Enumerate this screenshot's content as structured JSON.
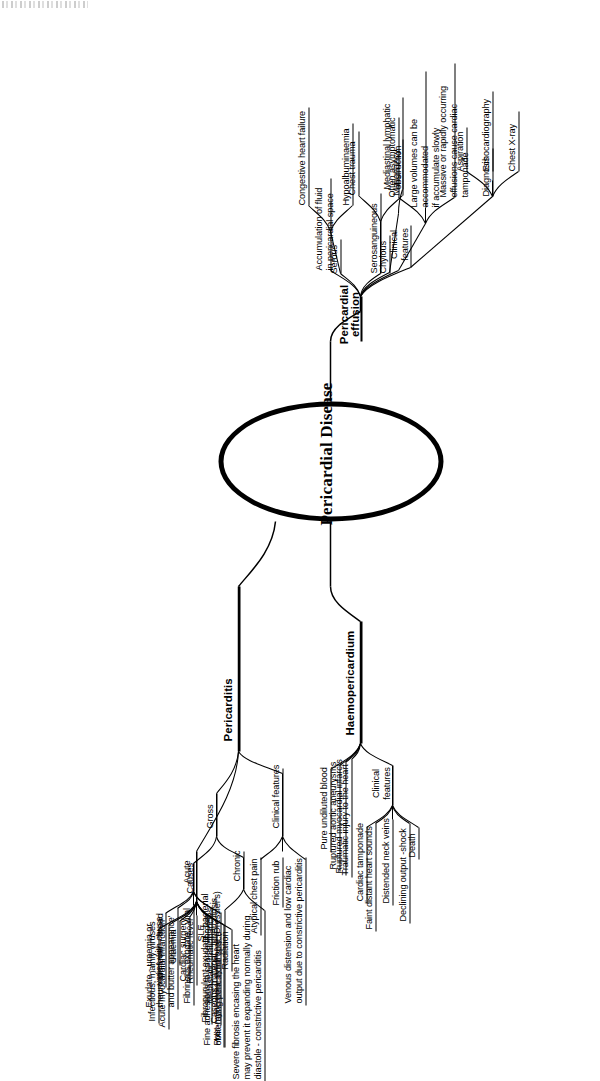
{
  "page": {
    "watermark": "",
    "width": 600,
    "height": 1041,
    "orientation": "rotated-90-ccw"
  },
  "diagram": {
    "type": "mind-map",
    "centre": "Pericardial Disease",
    "branches": [
      {
        "id": "pericarditis",
        "label": "Pericarditis",
        "children": [
          {
            "id": "causes",
            "label": "Causes",
            "children": [
              {
                "label": "Infectious, mainly viruses"
              },
              {
                "label": "Acute myocardial infarction"
              },
              {
                "label": "Uraemia"
              },
              {
                "label": "Cardiac surgery"
              },
              {
                "label": "Rheumatic fever"
              },
              {
                "label": "SLE"
              },
              {
                "label": "Metastatic malignancies"
              },
              {
                "label": "Post-myocardial syndrome (Dressler's)"
              },
              {
                "label": "Radiation"
              }
            ]
          },
          {
            "id": "gross",
            "label": "Gross",
            "children": [
              {
                "id": "acute",
                "label": "Acute",
                "children": [
                  {
                    "label": "varies with cause"
                  },
                  {
                    "label": "Exudate - uraemia or rheumatic fever - 'bread and butter appearance'"
                  },
                  {
                    "label": "Fibrinous exudate - viral"
                  },
                  {
                    "label": "Fibropurulent exudate - bacterial"
                  },
                  {
                    "label": "Caseous material - tuberculosis"
                  }
                ]
              },
              {
                "id": "chronic",
                "label": "Chronic",
                "children": [
                  {
                    "label": "Fine adhesions to coarse fibrosis obliterating pericardial space"
                  },
                  {
                    "label": "Severe fibrosis encasing the heart may prevent it expanding normally during diastole - constrictive pericarditis"
                  }
                ]
              }
            ]
          },
          {
            "id": "pericarditis-clinical",
            "label": "Clinical features",
            "children": [
              {
                "label": "Atypical chest pain"
              },
              {
                "label": "Friction rub"
              },
              {
                "label": "Venous distension and low cardiac output due to constrictive pericarditis"
              }
            ]
          }
        ]
      },
      {
        "id": "haemopericardium",
        "label": "Haemopericardium",
        "children": [
          {
            "label": "Pure undiluted blood"
          },
          {
            "label": "Ruptured aortic aneurysms"
          },
          {
            "label": "Ruptured myocardial infarcts"
          },
          {
            "label": "Traumatic injury to the heart"
          },
          {
            "id": "haemo-clinical",
            "label": "Clinical features",
            "children": [
              {
                "label": "Cardiac tamponade"
              },
              {
                "label": "Faint distant heart sounds"
              },
              {
                "label": "Distended neck veins"
              },
              {
                "label": "Declining output -shock"
              },
              {
                "label": "Death"
              }
            ]
          }
        ]
      },
      {
        "id": "pericardial-effusion",
        "label": "Pericardial effusion",
        "children": [
          {
            "label": "Accumulation of fluid in pericardial space"
          },
          {
            "id": "serous",
            "label": "Serous",
            "children": [
              {
                "label": "Congestive heart failure"
              },
              {
                "label": "Hypoalbuminaemia"
              }
            ]
          },
          {
            "id": "serosanguineous",
            "label": "Serosanguineous",
            "children": [
              {
                "label": "Chest trauma"
              },
              {
                "label": "Malignancy"
              }
            ]
          },
          {
            "id": "chylous",
            "label": "Chylous",
            "children": [
              {
                "label": "Mediastinal lymphatic obstruction"
              }
            ]
          },
          {
            "id": "effusion-clinical",
            "label": "Clinical features",
            "children": [
              {
                "label": "Often asymptomatic"
              },
              {
                "label": "Large volumes can be accommodated if accumulate slowly"
              },
              {
                "label": "Massive or rapidly occurring effusions cause cardiac tamponade"
              }
            ]
          },
          {
            "id": "diagnosis",
            "label": "Diagnosis",
            "children": [
              {
                "label": "Aspiration"
              },
              {
                "label": "Echocardiography"
              },
              {
                "label": "Chest X-ray"
              }
            ]
          }
        ]
      }
    ]
  },
  "labels": {
    "centre": "Pericardial Disease",
    "pericarditis": "Pericarditis",
    "haemopericardium": "Haemopericardium",
    "pericardial_effusion_l1": "Pericardial",
    "pericardial_effusion_l2": "effusion",
    "causes": "Causes",
    "gross": "Gross",
    "acute": "Acute",
    "chronic": "Chronic",
    "clinical_features": "Clinical features",
    "clinical_l1": "Clinical",
    "clinical_l2": "features",
    "serous": "Serous",
    "serosanguineous": "Serosanguineous",
    "chylous": "Chylous",
    "diagnosis": "Diagnosis",
    "c1": "Infectious, mainly viruses",
    "c2": "Acute myocardial infarction",
    "c3": "Uraemia",
    "c4": "Cardiac surgery",
    "c5": "Rheumatic fever",
    "c6": "SLE",
    "c7": "Metastatic malignancies",
    "c8": "Post-myocardial syndrome (Dressler's)",
    "c9": "Radiation",
    "a1": "varies with cause",
    "a2_l1": "Exudate - uraemia or",
    "a2_l2": "rheumatic fever - 'bread",
    "a2_l3": "and butter appearance'",
    "a3": "Fibrinous exudate - viral",
    "a4": "Fibropurulent exudate - bacterial",
    "a5": "Caseous material - tuberculosis",
    "ch1_l1": "Fine adhesions to coarse fibrosis",
    "ch1_l2": "obliterating pericardial space",
    "ch2_l1": "Severe fibrosis encasing the heart",
    "ch2_l2": "may prevent it expanding normally during",
    "ch2_l3": "diastole - constrictive pericarditis",
    "pc1": "Atypical chest pain",
    "pc2": "Friction rub",
    "pc3_l1": "Venous distension and low cardiac",
    "pc3_l2": "output due to constrictive pericarditis",
    "h1": "Pure undiluted blood",
    "h2": "Ruptured aortic aneurysms",
    "h3": "Ruptured myocardial infarcts",
    "h4": "Traumatic injury to the heart",
    "hc1": "Cardiac tamponade",
    "hc2": "Faint distant heart sounds",
    "hc3": "Distended neck veins",
    "hc4": "Declining output -shock",
    "hc5": "Death",
    "e1_l1": "Accumulation of fluid",
    "e1_l2": "in pericardial space",
    "s1": "Congestive heart failure",
    "s2": "Hypoalbuminaemia",
    "ss1": "Chest trauma",
    "ss2": "Malignancy",
    "cy1_l1": "Mediastinal lymphatic",
    "cy1_l2": "obstruction",
    "ec1": "Often asymptomatic",
    "ec2_l1": "Large volumes can be accommodated",
    "ec2_l2": "if accumulate slowly",
    "ec3_l1": "Massive or rapidly occurring",
    "ec3_l2": "effusions cause cardiac tamponade",
    "d1": "Aspiration",
    "d2": "Echocardiography",
    "d3": "Chest X-ray"
  },
  "colors": {
    "ink": "#000000",
    "paper": "#ffffff"
  }
}
